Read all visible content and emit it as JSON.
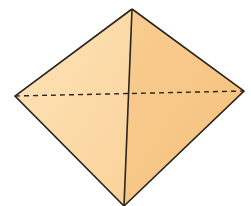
{
  "diagram": {
    "shape": "square-pyramid (octahedron-like view)",
    "vertices": {
      "top": [
        132,
        9
      ],
      "left": [
        15,
        96
      ],
      "right": [
        244,
        91
      ],
      "bottom": [
        124,
        206
      ]
    },
    "colors": {
      "left_face": "#fcdca8",
      "right_face": "#f8c888",
      "edge": "#2a2420",
      "background": "#ffffff"
    },
    "hidden_edge_style": "dashed"
  }
}
